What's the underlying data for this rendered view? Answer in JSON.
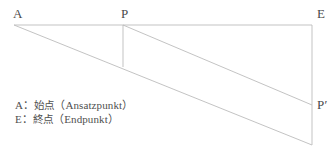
{
  "diagram": {
    "name": "sloped-line-construction-diagram",
    "stroke_color": "#bcbcbc",
    "text_color": "#4a4a4a",
    "background_color": "#ffffff",
    "vertices": {
      "A": {
        "label": "A",
        "x": 14,
        "y": 25
      },
      "P": {
        "label": "P",
        "x": 123,
        "y": 25
      },
      "E": {
        "label": "E",
        "x": 312,
        "y": 25
      },
      "P_prime": {
        "label": "P′",
        "x": 312,
        "y": 105
      },
      "foot_of_P": {
        "x": 123,
        "y": 67
      },
      "bottom_right": {
        "x": 312,
        "y": 145
      }
    },
    "segments": [
      {
        "name": "top-edge-A-to-E",
        "from": "A",
        "to": "E"
      },
      {
        "name": "right-edge-E-to-bottom",
        "from": "E",
        "to": "bottom_right"
      },
      {
        "name": "long-diagonal-A-to-bottom-right",
        "from": "A",
        "to": "bottom_right"
      },
      {
        "name": "diagonal-P-to-P-prime",
        "from": "P",
        "to": "P_prime"
      },
      {
        "name": "vertical-drop-from-P",
        "from": "P",
        "to": "foot_of_P"
      }
    ]
  },
  "legend": {
    "lines": [
      {
        "symbol": "A",
        "separator": "：",
        "japanese": "始点",
        "german": "（Ansatzpunkt）",
        "full": "A：始点（Ansatzpunkt）"
      },
      {
        "symbol": "E",
        "separator": "：",
        "japanese": "終点",
        "german": "（Endpunkt）",
        "full": "E：終点（Endpunkt）"
      }
    ]
  }
}
